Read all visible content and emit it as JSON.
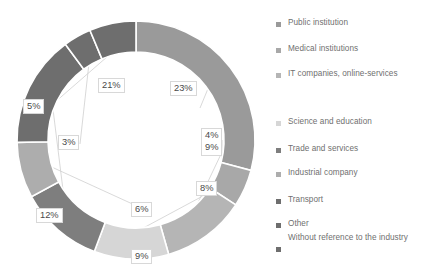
{
  "chart_data": {
    "type": "pie",
    "variant": "donut",
    "title": "",
    "subtitle": "",
    "xlabel": "",
    "ylabel": "",
    "legend_position": "right",
    "grid": false,
    "units": "percent",
    "total": 100,
    "start_angle_deg": 0,
    "direction": "clockwise",
    "categories": [
      "Public institution",
      "Medical institutions",
      "IT companies, online-services",
      "Science and education",
      "Trade and services",
      "Industrial company",
      "Transport",
      "Other",
      "Without reference to the industry"
    ],
    "values": [
      23,
      4,
      9,
      8,
      9,
      6,
      12,
      3,
      5
    ],
    "labels": [
      "23%",
      "4%",
      "9%",
      "8%",
      "9%",
      "6%",
      "12%",
      "3%",
      "5%"
    ],
    "colors": [
      "#9a9a9a",
      "#a8a8a8",
      "#b5b5b5",
      "#d6d6d6",
      "#7e7e7e",
      "#adadad",
      "#6e6e6e",
      "#6e6e6e",
      "#6e6e6e"
    ],
    "slices": [
      {
        "name": "Public institution",
        "value": 23,
        "label": "23%",
        "color": "#9a9a9a"
      },
      {
        "name": "Medical institutions",
        "value": 4,
        "label": "4%",
        "color": "#a8a8a8"
      },
      {
        "name": "IT companies, online-services",
        "value": 9,
        "label": "9%",
        "color": "#b5b5b5"
      },
      {
        "name": "Science and education",
        "value": 8,
        "label": "8%",
        "color": "#d6d6d6"
      },
      {
        "name": "Trade and services",
        "value": 9,
        "label": "9%",
        "color": "#7e7e7e"
      },
      {
        "name": "Industrial company",
        "value": 6,
        "label": "6%",
        "color": "#adadad"
      },
      {
        "name": "Transport",
        "value": 12,
        "label": "12%",
        "color": "#6e6e6e"
      },
      {
        "name": "Other",
        "value": 3,
        "label": "3%",
        "color": "#6e6e6e"
      },
      {
        "name": "Without reference to the industry",
        "value": 5,
        "label": "5%",
        "color": "#6e6e6e"
      }
    ]
  },
  "legend": {
    "items": [
      {
        "label": "Public institution",
        "color": "#9a9a9a"
      },
      {
        "label": "Medical institutions",
        "color": "#a8a8a8"
      },
      {
        "label": "IT companies, online-services",
        "color": "#b5b5b5"
      },
      {
        "label": "Science and education",
        "color": "#d6d6d6"
      },
      {
        "label": "Trade and services",
        "color": "#7e7e7e"
      },
      {
        "label": "Industrial company",
        "color": "#adadad"
      },
      {
        "label": "Transport",
        "color": "#6e6e6e"
      },
      {
        "label": "Other",
        "color": "#6e6e6e"
      },
      {
        "label": "Without reference to the industry",
        "color": "#6e6e6e"
      }
    ]
  },
  "data_labels": {
    "top_left": "21%",
    "top_right": "23%",
    "left_upper": "5%",
    "left_mid": "3%",
    "left_lower": "12%",
    "right_small": "4%",
    "right_mid": "9%",
    "right_lower": "8%",
    "bottom_right": "6%",
    "bottom": "9%"
  }
}
